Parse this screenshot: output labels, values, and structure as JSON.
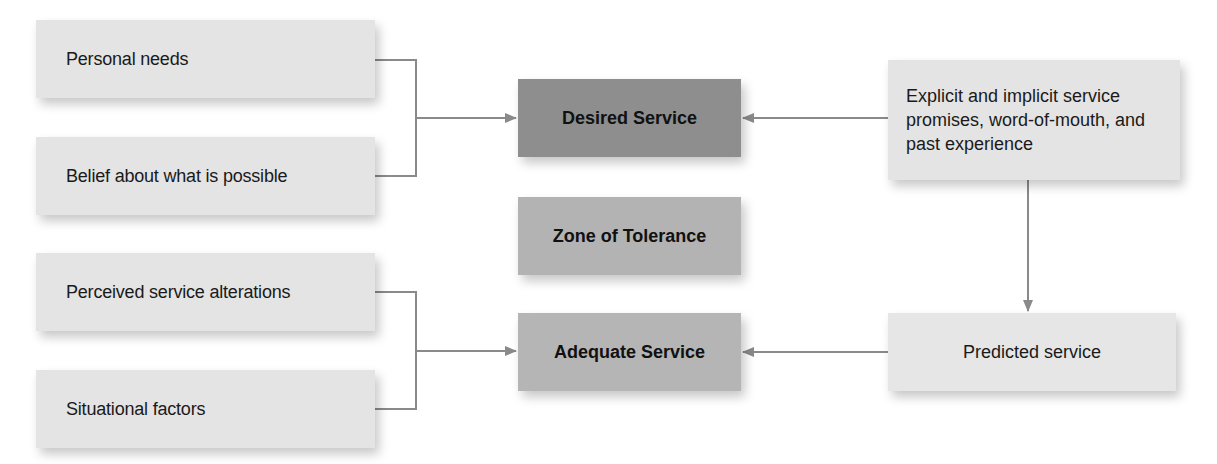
{
  "diagram": {
    "colors": {
      "input_box": "#e4e4e4",
      "desired_service": "#8e8e8e",
      "zone_of_tolerance": "#b3b3b3",
      "adequate_service": "#b5b5b5",
      "connector": "#8a8a8a"
    },
    "desired_inputs": [
      {
        "label": "Personal needs"
      },
      {
        "label": "Belief about what is possible"
      }
    ],
    "adequate_inputs": [
      {
        "label": "Perceived service alterations"
      },
      {
        "label": "Situational factors"
      }
    ],
    "center": {
      "desired": "Desired Service",
      "zone": "Zone of Tolerance",
      "adequate": "Adequate Service"
    },
    "right": {
      "source": "Explicit and implicit service promises, word-of-mouth, and past experience",
      "predicted": "Predicted service"
    },
    "edges": [
      {
        "from": "Personal needs",
        "to": "Desired Service"
      },
      {
        "from": "Belief about what is possible",
        "to": "Desired Service"
      },
      {
        "from": "Explicit and implicit service promises, word-of-mouth, and past experience",
        "to": "Desired Service"
      },
      {
        "from": "Explicit and implicit service promises, word-of-mouth, and past experience",
        "to": "Predicted service"
      },
      {
        "from": "Perceived service alterations",
        "to": "Adequate Service"
      },
      {
        "from": "Situational factors",
        "to": "Adequate Service"
      },
      {
        "from": "Predicted service",
        "to": "Adequate Service"
      }
    ]
  }
}
